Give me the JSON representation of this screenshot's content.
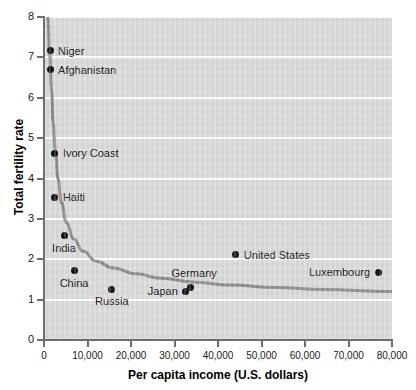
{
  "chart_data": {
    "type": "scatter",
    "title": "",
    "xlabel": "Per capita income (U.S. dollars)",
    "ylabel": "Total fertility rate",
    "xlim": [
      0,
      80000
    ],
    "ylim": [
      0,
      8
    ],
    "grid": true,
    "legend": "none",
    "xticks": [
      0,
      10000,
      20000,
      30000,
      40000,
      50000,
      60000,
      70000,
      80000
    ],
    "xtick_labels": [
      "0",
      "10,000",
      "20,000",
      "30,000",
      "40,000",
      "50,000",
      "60,000",
      "70,000",
      "80,000"
    ],
    "yticks": [
      0,
      1,
      2,
      3,
      4,
      5,
      6,
      7,
      8
    ],
    "ytick_labels": [
      "0",
      "1",
      "2",
      "3",
      "4",
      "5",
      "6",
      "7",
      "8"
    ],
    "points": [
      {
        "name": "Niger",
        "x": 1400,
        "y": 7.16,
        "label_side": "right"
      },
      {
        "name": "Afghanistan",
        "x": 1400,
        "y": 6.69,
        "label_side": "right"
      },
      {
        "name": "Ivory Coast",
        "x": 2500,
        "y": 4.63,
        "label_side": "right"
      },
      {
        "name": "Haiti",
        "x": 2500,
        "y": 3.54,
        "label_side": "right"
      },
      {
        "name": "India",
        "x": 4600,
        "y": 2.58,
        "label_side": "below"
      },
      {
        "name": "China",
        "x": 6900,
        "y": 1.71,
        "label_side": "below"
      },
      {
        "name": "Russia",
        "x": 15600,
        "y": 1.26,
        "label_side": "below"
      },
      {
        "name": "Japan",
        "x": 32600,
        "y": 1.21,
        "label_side": "left"
      },
      {
        "name": "Germany",
        "x": 33600,
        "y": 1.31,
        "label_side": "above"
      },
      {
        "name": "United States",
        "x": 44100,
        "y": 2.11,
        "label_side": "right"
      },
      {
        "name": "Luxembourg",
        "x": 76800,
        "y": 1.68,
        "label_side": "left"
      }
    ],
    "trend_line": {
      "description": "declining power-law fit curve",
      "color": "#8a8a8a",
      "points": [
        {
          "x": 900,
          "y": 8.0
        },
        {
          "x": 1300,
          "y": 7.1
        },
        {
          "x": 1700,
          "y": 6.2
        },
        {
          "x": 2100,
          "y": 5.4
        },
        {
          "x": 2600,
          "y": 4.7
        },
        {
          "x": 3200,
          "y": 4.0
        },
        {
          "x": 4000,
          "y": 3.4
        },
        {
          "x": 5200,
          "y": 2.9
        },
        {
          "x": 6800,
          "y": 2.5
        },
        {
          "x": 9000,
          "y": 2.2
        },
        {
          "x": 12000,
          "y": 1.95
        },
        {
          "x": 16000,
          "y": 1.78
        },
        {
          "x": 21000,
          "y": 1.64
        },
        {
          "x": 27000,
          "y": 1.53
        },
        {
          "x": 34000,
          "y": 1.44
        },
        {
          "x": 43000,
          "y": 1.36
        },
        {
          "x": 53000,
          "y": 1.3
        },
        {
          "x": 64000,
          "y": 1.25
        },
        {
          "x": 80000,
          "y": 1.2
        }
      ]
    },
    "colors": {
      "plot_background": "#d9d9d9",
      "gridline": "#ffffff",
      "point": "#111111",
      "axis": "#6e6e6e",
      "trend": "#8a8a8a",
      "text": "#111111"
    }
  }
}
